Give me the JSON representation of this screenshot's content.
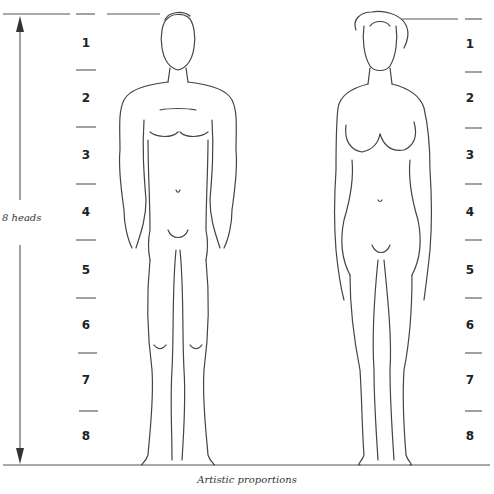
{
  "diagram": {
    "caption": "Artistic proportions",
    "measure_label": "8 heads",
    "left_scale": [
      "1",
      "2",
      "3",
      "4",
      "5",
      "6",
      "7",
      "8"
    ],
    "right_scale": [
      "1",
      "2",
      "3",
      "4",
      "5",
      "6",
      "7",
      "8"
    ],
    "figures": [
      "male-figure",
      "female-figure"
    ],
    "colors": {
      "line": "#555555",
      "text": "#222222",
      "background": "#ffffff"
    }
  }
}
